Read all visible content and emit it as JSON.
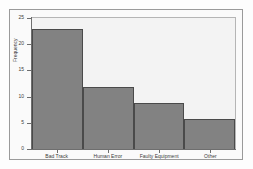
{
  "chart_data": {
    "type": "bar",
    "title": "",
    "xlabel": "",
    "ylabel": "Frequency",
    "categories": [
      "Bad Track",
      "Human Error",
      "Faulty Equipment",
      "Other"
    ],
    "values": [
      23,
      12,
      9,
      6
    ],
    "ylim": [
      0,
      25
    ],
    "ytick_labels": [
      "0",
      "5",
      "10",
      "15",
      "20",
      "25"
    ],
    "ytick_values": [
      0,
      5,
      10,
      15,
      20,
      25
    ],
    "grid": false,
    "legend": null,
    "bar_fill_color": "#828282",
    "bar_border_color": "#4a4a4a",
    "panel_background": "#f3f3f3",
    "figure_background": "#fafafa",
    "axis_color": "#6e6e6e"
  }
}
